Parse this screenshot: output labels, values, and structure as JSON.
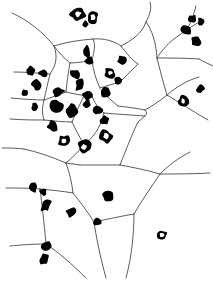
{
  "figure": {
    "type": "scientific-figure",
    "width": 213,
    "height": 284,
    "background_color": "#ffffff",
    "line_color": "#4a4a4a",
    "marker_color": "#000000",
    "has_frame": false,
    "has_axes": false,
    "has_labels": false,
    "has_legend": false
  },
  "chart_data": {
    "type": "scatter",
    "subtitle": "",
    "xlabel": "",
    "ylabel": "",
    "xlim": [
      0,
      213
    ],
    "ylim": [
      0,
      284
    ],
    "grid": false,
    "legend_position": "none",
    "annotations": [],
    "tick_labels": {
      "x": [],
      "y": []
    },
    "series": [
      {
        "name": "nuclei",
        "marker": "irregular-blob",
        "color": "#000000",
        "count": 42,
        "points": [
          {
            "x": 78,
            "y": 14,
            "rx": 7.5,
            "ry": 6.5,
            "rot": -20,
            "hole": true
          },
          {
            "x": 93,
            "y": 17,
            "rx": 5.5,
            "ry": 7.0,
            "rot": 15,
            "hole": true
          },
          {
            "x": 85,
            "y": 24,
            "rx": 3.0,
            "ry": 3.0,
            "rot": 0,
            "hole": false
          },
          {
            "x": 192,
            "y": 19,
            "rx": 4.0,
            "ry": 4.5,
            "rot": 30,
            "hole": false
          },
          {
            "x": 201,
            "y": 22,
            "rx": 3.5,
            "ry": 4.0,
            "rot": -10,
            "hole": false
          },
          {
            "x": 186,
            "y": 30,
            "rx": 5.5,
            "ry": 4.5,
            "rot": 10,
            "hole": false
          },
          {
            "x": 196,
            "y": 41,
            "rx": 5.0,
            "ry": 5.5,
            "rot": -25,
            "hole": false
          },
          {
            "x": 87,
            "y": 52,
            "rx": 3.5,
            "ry": 6.0,
            "rot": -5,
            "hole": false
          },
          {
            "x": 89,
            "y": 61,
            "rx": 4.0,
            "ry": 4.5,
            "rot": 20,
            "hole": false
          },
          {
            "x": 31,
            "y": 71,
            "rx": 4.0,
            "ry": 5.5,
            "rot": -15,
            "hole": false
          },
          {
            "x": 43,
            "y": 73,
            "rx": 4.5,
            "ry": 4.0,
            "rot": 10,
            "hole": false
          },
          {
            "x": 37,
            "y": 85,
            "rx": 5.0,
            "ry": 5.0,
            "rot": 25,
            "hole": false
          },
          {
            "x": 75,
            "y": 74,
            "rx": 5.5,
            "ry": 5.0,
            "rot": -20,
            "hole": false
          },
          {
            "x": 80,
            "y": 85,
            "rx": 4.5,
            "ry": 6.0,
            "rot": 15,
            "hole": false
          },
          {
            "x": 58,
            "y": 92,
            "rx": 6.0,
            "ry": 4.5,
            "rot": -10,
            "hole": false
          },
          {
            "x": 110,
            "y": 73,
            "rx": 5.5,
            "ry": 5.0,
            "rot": 30,
            "hole": true
          },
          {
            "x": 118,
            "y": 80,
            "rx": 4.0,
            "ry": 4.0,
            "rot": 0,
            "hole": false
          },
          {
            "x": 88,
            "y": 95,
            "rx": 5.0,
            "ry": 5.5,
            "rot": -15,
            "hole": false
          },
          {
            "x": 106,
            "y": 93,
            "rx": 5.5,
            "ry": 5.0,
            "rot": 10,
            "hole": false
          },
          {
            "x": 35,
            "y": 107,
            "rx": 4.0,
            "ry": 4.0,
            "rot": 0,
            "hole": false
          },
          {
            "x": 56,
            "y": 106,
            "rx": 6.5,
            "ry": 6.5,
            "rot": -10,
            "hole": false
          },
          {
            "x": 72,
            "y": 110,
            "rx": 6.0,
            "ry": 7.0,
            "rot": 20,
            "hole": false
          },
          {
            "x": 98,
            "y": 110,
            "rx": 5.0,
            "ry": 5.0,
            "rot": 0,
            "hole": false
          },
          {
            "x": 87,
            "y": 104,
            "rx": 4.0,
            "ry": 4.5,
            "rot": 15,
            "hole": false
          },
          {
            "x": 105,
            "y": 120,
            "rx": 5.0,
            "ry": 4.5,
            "rot": -20,
            "hole": false
          },
          {
            "x": 53,
            "y": 126,
            "rx": 5.5,
            "ry": 5.0,
            "rot": 10,
            "hole": false
          },
          {
            "x": 106,
            "y": 136,
            "rx": 6.0,
            "ry": 6.5,
            "rot": 0,
            "hole": true
          },
          {
            "x": 64,
            "y": 141,
            "rx": 5.5,
            "ry": 6.0,
            "rot": -10,
            "hole": true
          },
          {
            "x": 84,
            "y": 147,
            "rx": 6.5,
            "ry": 7.0,
            "rot": 15,
            "hole": true
          },
          {
            "x": 33,
            "y": 188,
            "rx": 4.5,
            "ry": 5.0,
            "rot": -20,
            "hole": false
          },
          {
            "x": 43,
            "y": 192,
            "rx": 3.5,
            "ry": 3.5,
            "rot": 0,
            "hole": false
          },
          {
            "x": 46,
            "y": 205,
            "rx": 4.5,
            "ry": 7.0,
            "rot": 20,
            "hole": false
          },
          {
            "x": 71,
            "y": 212,
            "rx": 4.5,
            "ry": 5.0,
            "rot": -10,
            "hole": false
          },
          {
            "x": 97,
            "y": 222,
            "rx": 4.0,
            "ry": 3.5,
            "rot": 25,
            "hole": false
          },
          {
            "x": 108,
            "y": 196,
            "rx": 5.0,
            "ry": 5.0,
            "rot": 0,
            "hole": false
          },
          {
            "x": 46,
            "y": 246,
            "rx": 5.5,
            "ry": 4.0,
            "rot": -25,
            "hole": false
          },
          {
            "x": 44,
            "y": 259,
            "rx": 4.5,
            "ry": 6.0,
            "rot": 10,
            "hole": false
          },
          {
            "x": 162,
            "y": 235,
            "rx": 5.0,
            "ry": 5.0,
            "rot": 15,
            "hole": true
          },
          {
            "x": 200,
            "y": 89,
            "rx": 4.0,
            "ry": 4.0,
            "rot": 0,
            "hole": false
          },
          {
            "x": 183,
            "y": 101,
            "rx": 5.0,
            "ry": 5.5,
            "rot": -30,
            "hole": true
          },
          {
            "x": 122,
            "y": 60,
            "rx": 4.5,
            "ry": 4.0,
            "rot": 0,
            "hole": false
          },
          {
            "x": 25,
            "y": 93,
            "rx": 3.0,
            "ry": 3.5,
            "rot": 0,
            "hole": false
          }
        ]
      }
    ],
    "tessellation": {
      "name": "voronoi-edges",
      "edge_count": 46,
      "color": "#4a4a4a"
    }
  }
}
